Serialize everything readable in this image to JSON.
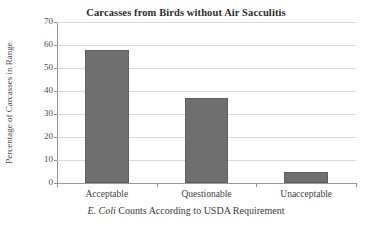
{
  "chart_data": {
    "type": "bar",
    "title": "Carcasses from Birds without Air Sacculitis",
    "xlabel_italic": "E. Coli",
    "xlabel_rest": " Counts According to USDA Requirement",
    "xlabel": "E. Coli Counts According to USDA Requirement",
    "ylabel": "Percentage of Carcasses in Range",
    "categories": [
      "Acceptable",
      "Questionable",
      "Unacceptable"
    ],
    "values": [
      58,
      37,
      5
    ],
    "series": [
      {
        "name": "Percentage of Carcasses in Range",
        "values": [
          58,
          37,
          5
        ]
      }
    ],
    "ylim": [
      0,
      70
    ],
    "yticks": [
      0,
      10,
      20,
      30,
      40,
      50,
      60,
      70
    ],
    "ytick_labels": [
      "0",
      "10",
      "20",
      "30",
      "40",
      "50",
      "60",
      "70"
    ],
    "grid": true,
    "grid_axis": "y",
    "legend": false,
    "legend_position": "none",
    "bar_color": "#6f6f6f",
    "gridline_color": "#d9d9d9",
    "axis_color": "#8f8f8f",
    "background_color": "#ffffff"
  }
}
